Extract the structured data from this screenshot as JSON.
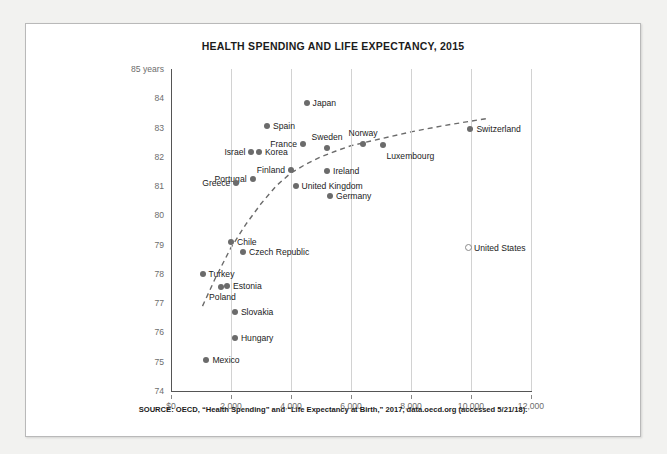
{
  "chart_data": {
    "type": "scatter",
    "title": "HEALTH SPENDING AND LIFE EXPECTANCY, 2015",
    "xlabel": "",
    "ylabel": "",
    "xlim": [
      0,
      12000
    ],
    "ylim": [
      74,
      85
    ],
    "xticks": [
      "$0",
      "2,000",
      "4,000",
      "6,000",
      "8,000",
      "10,000",
      "12,000"
    ],
    "xtick_values": [
      0,
      2000,
      4000,
      6000,
      8000,
      10000,
      12000
    ],
    "yticks": [
      "85 years",
      "84",
      "83",
      "82",
      "81",
      "80",
      "79",
      "78",
      "77",
      "76",
      "75",
      "74"
    ],
    "ytick_values": [
      85,
      84,
      83,
      82,
      81,
      80,
      79,
      78,
      77,
      76,
      75,
      74
    ],
    "grid": "vertical",
    "legend": "none",
    "points": [
      {
        "name": "Japan",
        "x": 4520,
        "y": 83.85,
        "marker": "filled",
        "label_pos": "right"
      },
      {
        "name": "Spain",
        "x": 3200,
        "y": 83.05,
        "marker": "filled",
        "label_pos": "right"
      },
      {
        "name": "Switzerland",
        "x": 9980,
        "y": 82.95,
        "marker": "filled",
        "label_pos": "right"
      },
      {
        "name": "Norway",
        "x": 6400,
        "y": 82.45,
        "marker": "filled",
        "label_pos": "above"
      },
      {
        "name": "Luxembourg",
        "x": 7050,
        "y": 82.4,
        "marker": "filled",
        "label_pos": "below-right"
      },
      {
        "name": "Sweden",
        "x": 5200,
        "y": 82.3,
        "marker": "filled",
        "label_pos": "above"
      },
      {
        "name": "France",
        "x": 4400,
        "y": 82.45,
        "marker": "filled",
        "label_pos": "left"
      },
      {
        "name": "Israel",
        "x": 2680,
        "y": 82.15,
        "marker": "filled",
        "label_pos": "left"
      },
      {
        "name": "Korea",
        "x": 2930,
        "y": 82.15,
        "marker": "filled",
        "label_pos": "right"
      },
      {
        "name": "Finland",
        "x": 4000,
        "y": 81.55,
        "marker": "filled",
        "label_pos": "left"
      },
      {
        "name": "Ireland",
        "x": 5200,
        "y": 81.5,
        "marker": "filled",
        "label_pos": "right"
      },
      {
        "name": "Portugal",
        "x": 2720,
        "y": 81.25,
        "marker": "filled",
        "label_pos": "left"
      },
      {
        "name": "United Kingdom",
        "x": 4150,
        "y": 81.0,
        "marker": "filled",
        "label_pos": "right"
      },
      {
        "name": "Greece",
        "x": 2180,
        "y": 81.1,
        "marker": "filled",
        "label_pos": "left"
      },
      {
        "name": "Germany",
        "x": 5300,
        "y": 80.65,
        "marker": "filled",
        "label_pos": "right"
      },
      {
        "name": "United States",
        "x": 9900,
        "y": 78.9,
        "marker": "hollow",
        "label_pos": "right"
      },
      {
        "name": "Chile",
        "x": 2000,
        "y": 79.1,
        "marker": "filled",
        "label_pos": "right"
      },
      {
        "name": "Czech Republic",
        "x": 2400,
        "y": 78.75,
        "marker": "filled",
        "label_pos": "right"
      },
      {
        "name": "Turkey",
        "x": 1050,
        "y": 78.0,
        "marker": "filled",
        "label_pos": "right"
      },
      {
        "name": "Estonia",
        "x": 1870,
        "y": 77.6,
        "marker": "filled",
        "label_pos": "right"
      },
      {
        "name": "Poland",
        "x": 1650,
        "y": 77.55,
        "marker": "filled",
        "label_pos": "below-left"
      },
      {
        "name": "Slovakia",
        "x": 2130,
        "y": 76.7,
        "marker": "filled",
        "label_pos": "right"
      },
      {
        "name": "Hungary",
        "x": 2130,
        "y": 75.8,
        "marker": "filled",
        "label_pos": "right"
      },
      {
        "name": "Mexico",
        "x": 1180,
        "y": 75.05,
        "marker": "filled",
        "label_pos": "right"
      }
    ],
    "trendline": {
      "style": "dashed",
      "color": "#6b6b6b",
      "points": [
        [
          1050,
          76.9
        ],
        [
          1500,
          77.9
        ],
        [
          2000,
          78.9
        ],
        [
          2500,
          79.7
        ],
        [
          3000,
          80.4
        ],
        [
          3500,
          81.0
        ],
        [
          4000,
          81.45
        ],
        [
          4500,
          81.75
        ],
        [
          5000,
          82.0
        ],
        [
          5500,
          82.2
        ],
        [
          6000,
          82.38
        ],
        [
          7000,
          82.62
        ],
        [
          8000,
          82.85
        ],
        [
          9000,
          83.05
        ],
        [
          10000,
          83.22
        ],
        [
          10600,
          83.32
        ]
      ]
    }
  },
  "source": {
    "note": "SOURCE: OECD, “Health Spending” and “Life Expectancy at Birth,” 2017, data.oecd.org (accessed 5/21/18)."
  }
}
